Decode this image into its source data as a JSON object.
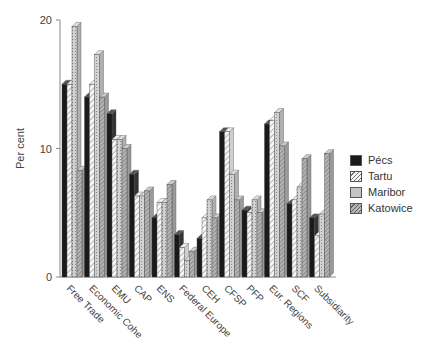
{
  "chart_data": {
    "type": "bar",
    "title": "",
    "xlabel": "",
    "ylabel": "Per cent",
    "ylim": [
      0,
      20
    ],
    "yticks": [
      0,
      10,
      20
    ],
    "grid": false,
    "legend_position": "right",
    "style": "3d-clustered",
    "categories": [
      "Free Trade",
      "Economic Cohe",
      "EMU",
      "CAP",
      "ENS",
      "Federal Europe",
      "CEH",
      "CFSP",
      "PFP",
      "Eur. Regions",
      "SCF",
      "Subsidiarity"
    ],
    "series": [
      {
        "name": "Pécs",
        "pattern": "solid-black",
        "values": [
          15.0,
          14.0,
          12.7,
          8.0,
          4.6,
          3.3,
          3.0,
          11.3,
          5.2,
          11.9,
          5.7,
          4.6
        ]
      },
      {
        "name": "Tartu",
        "pattern": "diagonal-hatch",
        "values": [
          15.0,
          15.0,
          10.7,
          6.3,
          5.8,
          2.3,
          4.6,
          11.3,
          5.0,
          12.2,
          6.0,
          3.2
        ]
      },
      {
        "name": "Maribor",
        "pattern": "dotted-grey",
        "values": [
          19.5,
          17.3,
          10.7,
          6.3,
          5.8,
          1.3,
          6.0,
          8.0,
          6.0,
          12.8,
          7.0,
          4.9
        ]
      },
      {
        "name": "Katowice",
        "pattern": "grey-hatch",
        "values": [
          8.3,
          14.0,
          10.0,
          6.7,
          7.2,
          2.0,
          4.6,
          6.0,
          5.0,
          10.2,
          9.2,
          9.6
        ]
      }
    ]
  },
  "axis": {
    "ylabel": "Per cent",
    "ticks": [
      "0",
      "10",
      "20"
    ]
  },
  "legend": {
    "items": [
      {
        "label": "Pécs",
        "color": "#1a1a1a"
      },
      {
        "label": "Tartu",
        "color": "#f4f4f4"
      },
      {
        "label": "Maribor",
        "color": "#c8c8c8"
      },
      {
        "label": "Katowice",
        "color": "#a8a8a8"
      }
    ]
  }
}
